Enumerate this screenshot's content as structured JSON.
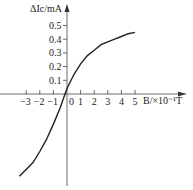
{
  "chart_data": {
    "type": "line",
    "title": "",
    "xlabel": "B/×10⁻¹T",
    "ylabel": "ΔIc/mA",
    "x_ticks": [
      "−3",
      "−2",
      "−1",
      "0",
      "1",
      "2",
      "3",
      "4",
      "5"
    ],
    "y_ticks": [
      "0.1",
      "0.2",
      "0.3",
      "0.4",
      "0.5"
    ],
    "xlim": [
      -4.5,
      8
    ],
    "ylim": [
      -0.65,
      0.65
    ],
    "grid": false,
    "legend": null,
    "series": [
      {
        "name": "ΔIc vs B",
        "x": [
          -3.5,
          -3,
          -2.5,
          -2,
          -1.5,
          -1,
          -0.5,
          -0.15,
          0,
          0.5,
          1,
          1.5,
          2,
          2.5,
          3,
          3.5,
          4,
          4.5,
          5
        ],
        "y": [
          -0.6,
          -0.55,
          -0.5,
          -0.42,
          -0.33,
          -0.22,
          -0.1,
          0,
          0.04,
          0.14,
          0.22,
          0.28,
          0.32,
          0.36,
          0.38,
          0.4,
          0.42,
          0.44,
          0.45
        ]
      }
    ]
  },
  "labels": {
    "y_axis": "ΔIc/mA",
    "x_axis": "B/×10⁻¹T"
  }
}
